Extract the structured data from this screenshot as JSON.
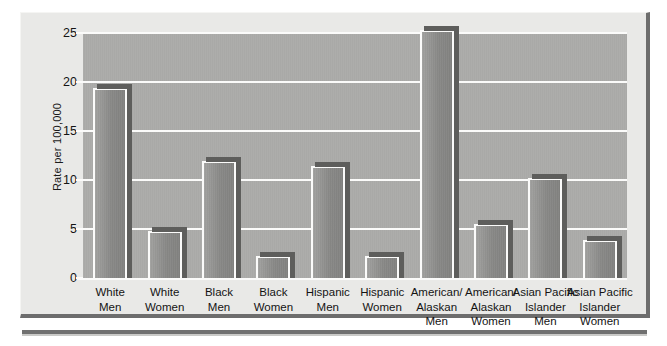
{
  "chart_data": {
    "type": "bar",
    "title": "",
    "xlabel": "",
    "ylabel": "Rate per 100,000",
    "ylim": [
      0,
      25
    ],
    "yticks": [
      0,
      5,
      10,
      15,
      20,
      25
    ],
    "grid": true,
    "legend": false,
    "categories": [
      "White Men",
      "White Women",
      "Black Men",
      "Black Women",
      "Hispanic Men",
      "Hispanic Women",
      "American/ Alaskan Men",
      "American/ Alaskan Women",
      "Asian Pacific Islander Men",
      "Asian Pacific Islander Women"
    ],
    "category_lines": [
      [
        "White",
        "Men"
      ],
      [
        "White",
        "Women"
      ],
      [
        "Black",
        "Men"
      ],
      [
        "Black",
        "Women"
      ],
      [
        "Hispanic",
        "Men"
      ],
      [
        "Hispanic",
        "Women"
      ],
      [
        "American/",
        "Alaskan",
        "Men"
      ],
      [
        "American/",
        "Alaskan",
        "Women"
      ],
      [
        "Asian Pacific",
        "Islander",
        "Men"
      ],
      [
        "Asian Pacific",
        "Islander",
        "Women"
      ]
    ],
    "values": [
      19.4,
      4.8,
      11.9,
      2.2,
      11.4,
      2.2,
      25.3,
      5.5,
      10.2,
      3.9
    ],
    "colors": {
      "bar_fill": "#8e8e8c",
      "bar_outline": "#fbfbfa",
      "bar_shadow": "#5e5e5c",
      "plot_background": "#a9a9a7",
      "panel_background": "#e9e9e7",
      "gridline": "#fbfbfa",
      "text": "#141414",
      "frame_shadow": "#6d6d6d"
    }
  },
  "axis": {
    "y_tick_labels": [
      "0",
      "5",
      "10",
      "15",
      "20",
      "25"
    ],
    "y_axis_title": "Rate per 100,000"
  }
}
